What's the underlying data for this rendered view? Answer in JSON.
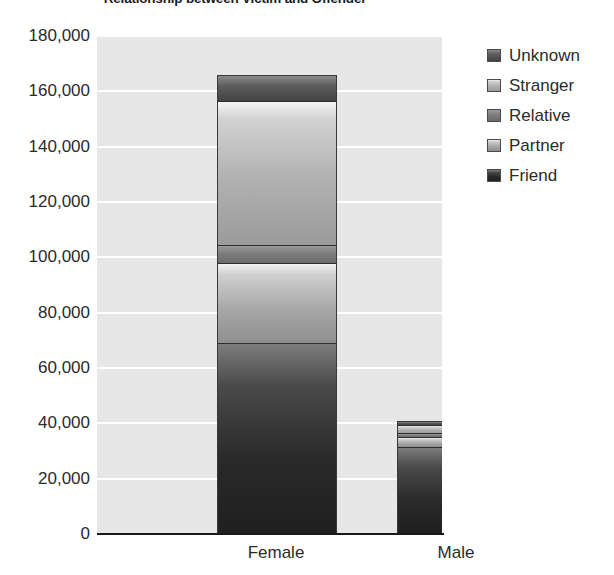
{
  "chart_data": {
    "type": "bar",
    "subtype": "stacked-vertical",
    "title": "Relationship between Victim and Offender",
    "xlabel": "",
    "ylabel": "",
    "categories": [
      "Female",
      "Male"
    ],
    "ylim": [
      0,
      180000
    ],
    "ytick_step": 20000,
    "ytick_labels": [
      "180,000",
      "160,000",
      "140,000",
      "120,000",
      "100,000",
      "80,000",
      "60,000",
      "40,000",
      "20,000",
      "0"
    ],
    "ytick_values": [
      180000,
      160000,
      140000,
      120000,
      100000,
      80000,
      60000,
      40000,
      20000,
      0
    ],
    "grid": true,
    "grid_color": "#ffffff",
    "plot_background": "#e7e7e7",
    "legend_position": "right",
    "stack_order_bottom_to_top": [
      "Friend",
      "Partner",
      "Relative",
      "Stranger",
      "Unknown"
    ],
    "series": [
      {
        "name": "Friend",
        "color": "#2a2a2a",
        "values": [
          69000,
          31500
        ]
      },
      {
        "name": "Partner",
        "color": "#b4b4b4",
        "values": [
          29000,
          3500
        ]
      },
      {
        "name": "Relative",
        "color": "#7d7d7d",
        "values": [
          6500,
          1500
        ]
      },
      {
        "name": "Stranger",
        "color": "#bdbdbd",
        "values": [
          52000,
          3000
        ]
      },
      {
        "name": "Unknown",
        "color": "#545454",
        "values": [
          9500,
          1500
        ]
      }
    ],
    "totals": [
      166000,
      41000
    ]
  },
  "legend": {
    "items": [
      {
        "label": "Unknown",
        "color": "#545454"
      },
      {
        "label": "Stranger",
        "color": "#bdbdbd"
      },
      {
        "label": "Relative",
        "color": "#7d7d7d"
      },
      {
        "label": "Partner",
        "color": "#b4b4b4"
      },
      {
        "label": "Friend",
        "color": "#2a2a2a"
      }
    ]
  }
}
